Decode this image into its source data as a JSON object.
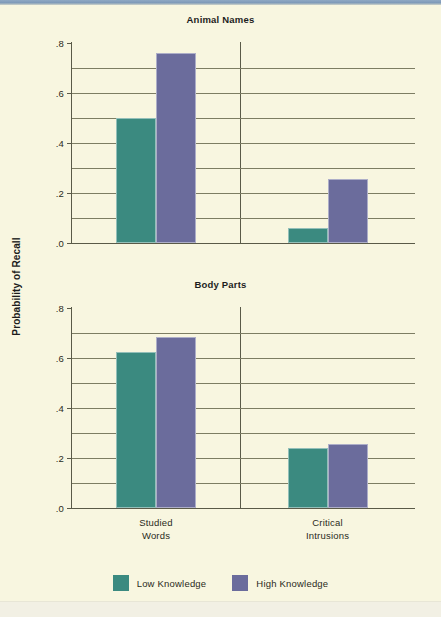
{
  "figure": {
    "ylabel": "Probability of Recall"
  },
  "legend": {
    "items": [
      {
        "label": "Low Knowledge",
        "color": "#3b8a80"
      },
      {
        "label": "High Knowledge",
        "color": "#6b6c9c"
      }
    ]
  },
  "axis": {
    "ticks": [
      {
        "label": ".0",
        "value": 0.0
      },
      {
        "label": ".2",
        "value": 0.2
      },
      {
        "label": ".4",
        "value": 0.4
      },
      {
        "label": ".6",
        "value": 0.6
      },
      {
        "label": ".8",
        "value": 0.8
      }
    ],
    "gridlines": [
      0.1,
      0.2,
      0.3,
      0.4,
      0.5,
      0.6,
      0.7
    ]
  },
  "categories": [
    {
      "line1": "Studied",
      "line2": "Words"
    },
    {
      "line1": "Critical",
      "line2": "Intrusions"
    }
  ],
  "chart_data": [
    {
      "type": "bar",
      "title": "Animal Names",
      "xlabel": "",
      "ylabel": "Probability of Recall",
      "ylim": [
        0.0,
        0.8
      ],
      "grid": true,
      "legend_position": "bottom",
      "categories": [
        "Studied Words",
        "Critical Intrusions"
      ],
      "series": [
        {
          "name": "Low Knowledge",
          "color": "#3b8a80",
          "values": [
            0.5,
            0.06
          ]
        },
        {
          "name": "High Knowledge",
          "color": "#6b6c9c",
          "values": [
            0.76,
            0.255
          ]
        }
      ]
    },
    {
      "type": "bar",
      "title": "Body Parts",
      "xlabel": "",
      "ylabel": "Probability of Recall",
      "ylim": [
        0.0,
        0.8
      ],
      "grid": true,
      "legend_position": "bottom",
      "categories": [
        "Studied Words",
        "Critical Intrusions"
      ],
      "series": [
        {
          "name": "Low Knowledge",
          "color": "#3b8a80",
          "values": [
            0.625,
            0.24
          ]
        },
        {
          "name": "High Knowledge",
          "color": "#6b6c9c",
          "values": [
            0.685,
            0.255
          ]
        }
      ]
    }
  ]
}
